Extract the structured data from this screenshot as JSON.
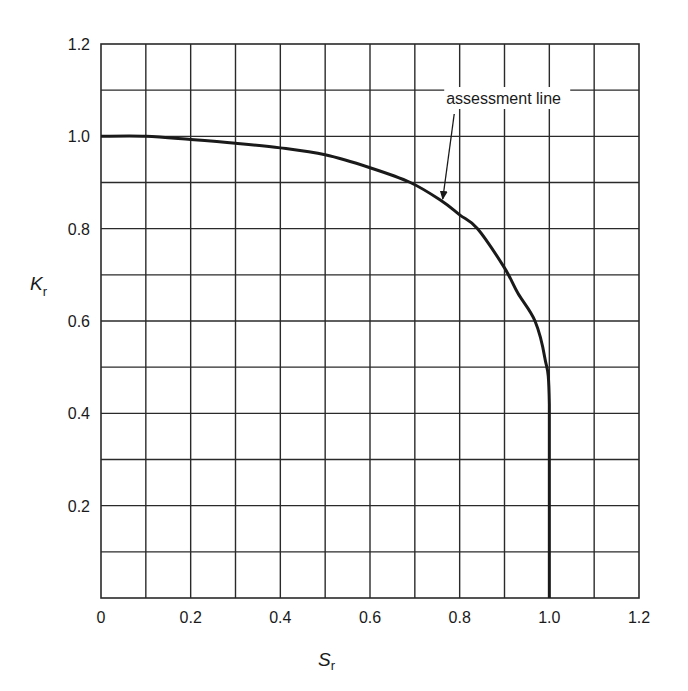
{
  "chart_data": {
    "type": "line",
    "title": "",
    "xlabel": "S",
    "xlabel_subscript": "r",
    "ylabel": "K",
    "ylabel_subscript": "r",
    "xlim": [
      0,
      1.2
    ],
    "ylim": [
      0,
      1.2
    ],
    "grid": true,
    "grid_step": 0.1,
    "x_ticks": [
      "0",
      "0.2",
      "0.4",
      "0.6",
      "0.8",
      "1.0",
      "1.2"
    ],
    "y_ticks": [
      "0.2",
      "0.4",
      "0.6",
      "0.8",
      "1.0",
      "1.2"
    ],
    "legend": null,
    "series": [
      {
        "name": "assessment line",
        "x": [
          0,
          0.1,
          0.2,
          0.3,
          0.4,
          0.5,
          0.6,
          0.69,
          0.76,
          0.8,
          0.84,
          0.9,
          0.93,
          0.968,
          0.99,
          1.0,
          1.0
        ],
        "y": [
          1.0,
          1.0,
          0.993,
          0.985,
          0.975,
          0.96,
          0.932,
          0.9,
          0.86,
          0.83,
          0.8,
          0.715,
          0.66,
          0.6,
          0.52,
          0.42,
          0.0
        ]
      }
    ],
    "annotations": [
      {
        "text": "assessment line",
        "text_x": 0.77,
        "text_y": 1.07,
        "arrow_to_x": 0.76,
        "arrow_to_y": 0.86
      }
    ]
  },
  "colors": {
    "line": "#1a1a1a",
    "grid": "#2a2a2a",
    "background": "#ffffff"
  }
}
